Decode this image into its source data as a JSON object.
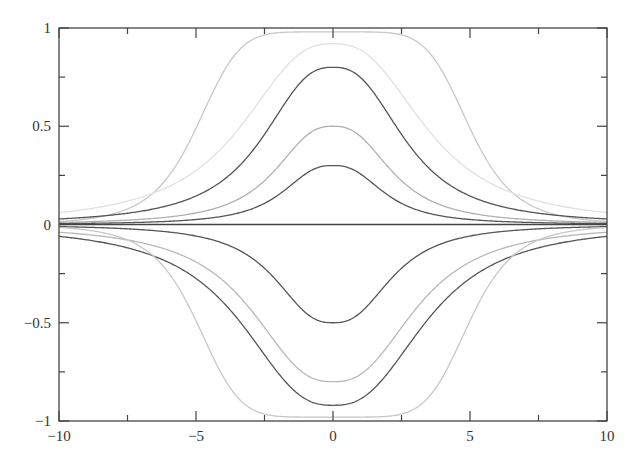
{
  "chart_data": {
    "type": "line",
    "title": "",
    "xlabel": "",
    "ylabel": "",
    "xlim": [
      -10,
      10
    ],
    "ylim": [
      -1,
      1
    ],
    "grid": false,
    "legend": null,
    "x_ticks": [
      -10,
      -5,
      0,
      5,
      10
    ],
    "x_tick_labels": [
      "-10",
      "-5",
      "0",
      "5",
      "10"
    ],
    "x_minor_ticks": [
      -7.5,
      -2.5,
      2.5,
      7.5
    ],
    "y_ticks": [
      -1,
      -0.5,
      0,
      0.5,
      1
    ],
    "y_tick_labels": [
      "-1",
      "-0.5",
      "0",
      "0.5",
      "1"
    ],
    "y_minor_ticks": [
      -0.75,
      -0.25,
      0.25,
      0.75
    ],
    "zero_line": true,
    "series": [
      {
        "name": "upper-1",
        "amplitude": 0.98,
        "half_width": 5.0,
        "color": "#c8c8c8",
        "shape": "flat-top bell"
      },
      {
        "name": "upper-2",
        "amplitude": 0.92,
        "half_width": 3.6,
        "color": "#e0e0e0",
        "shape": "bell"
      },
      {
        "name": "upper-3",
        "amplitude": 0.8,
        "half_width": 2.8,
        "color": "#555555",
        "shape": "bell"
      },
      {
        "name": "upper-4",
        "amplitude": 0.5,
        "half_width": 2.3,
        "color": "#b0b0b0",
        "shape": "bell"
      },
      {
        "name": "upper-5",
        "amplitude": 0.3,
        "half_width": 2.0,
        "color": "#555555",
        "shape": "bell"
      },
      {
        "name": "lower-1",
        "amplitude": -0.5,
        "half_width": 2.3,
        "color": "#555555",
        "shape": "bell"
      },
      {
        "name": "lower-2",
        "amplitude": -0.8,
        "half_width": 3.2,
        "color": "#b8b8b8",
        "shape": "bell"
      },
      {
        "name": "lower-3",
        "amplitude": -0.92,
        "half_width": 3.6,
        "color": "#555555",
        "shape": "bell"
      },
      {
        "name": "lower-4",
        "amplitude": -0.98,
        "half_width": 5.0,
        "color": "#c8c8c8",
        "shape": "flat-top bell"
      }
    ]
  }
}
